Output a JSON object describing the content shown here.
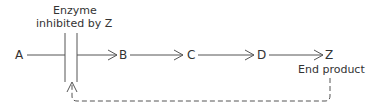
{
  "diagram": {
    "enzyme_label_line1": "Enzyme",
    "enzyme_label_line2": "inhibited by Z",
    "nodes": [
      "A",
      "B",
      "C",
      "D",
      "Z"
    ],
    "end_product_label": "End product",
    "colors": {
      "line": "#444444",
      "text": "#333333"
    }
  }
}
